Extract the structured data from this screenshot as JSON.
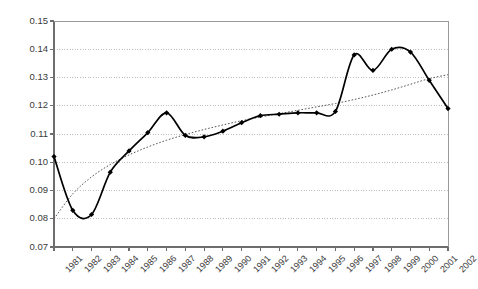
{
  "chart_data": {
    "type": "line",
    "title": "",
    "subtitle": "",
    "xlabel": "",
    "ylabel": "",
    "xlim": [
      1981,
      2002
    ],
    "ylim": [
      0.07,
      0.15
    ],
    "yticks": [
      "0.07",
      "0.08",
      "0.09",
      "0.10",
      "0.11",
      "0.12",
      "0.13",
      "0.14",
      "0.15"
    ],
    "ytick_values": [
      0.07,
      0.08,
      0.09,
      0.1,
      0.11,
      0.12,
      0.13,
      0.14,
      0.15
    ],
    "grid": "horizontal-dotted",
    "legend": "none",
    "categories": [
      "1981",
      "1982",
      "1983",
      "1984",
      "1985",
      "1986",
      "1987",
      "1988",
      "1989",
      "1990",
      "1991",
      "1992",
      "1993",
      "1994",
      "1995",
      "1996",
      "1997",
      "1998",
      "1999",
      "2000",
      "2001",
      "2002"
    ],
    "x": [
      1981,
      1982,
      1983,
      1984,
      1985,
      1986,
      1987,
      1988,
      1989,
      1990,
      1991,
      1992,
      1993,
      1994,
      1995,
      1996,
      1997,
      1998,
      1999,
      2000,
      2001,
      2002
    ],
    "series": [
      {
        "name": "observed",
        "style": "solid-with-markers",
        "color": "#000000",
        "marker": "diamond",
        "values": [
          0.102,
          0.083,
          0.0815,
          0.0965,
          0.104,
          0.1105,
          0.1175,
          0.1095,
          0.109,
          0.111,
          0.114,
          0.1165,
          0.117,
          0.1175,
          0.1175,
          0.118,
          0.138,
          0.1325,
          0.14,
          0.139,
          0.129,
          0.119
        ]
      },
      {
        "name": "trend",
        "style": "dotted",
        "color": "#555555",
        "marker": "none",
        "values": [
          0.08,
          0.0888,
          0.0948,
          0.0992,
          0.1026,
          0.1054,
          0.1078,
          0.1098,
          0.1116,
          0.1132,
          0.1147,
          0.116,
          0.1172,
          0.1184,
          0.1196,
          0.1208,
          0.1222,
          0.1238,
          0.1256,
          0.1276,
          0.1296,
          0.131
        ]
      }
    ]
  },
  "axes": {
    "plot_left": 54,
    "plot_right": 448,
    "plot_top": 21,
    "plot_bottom": 247
  }
}
